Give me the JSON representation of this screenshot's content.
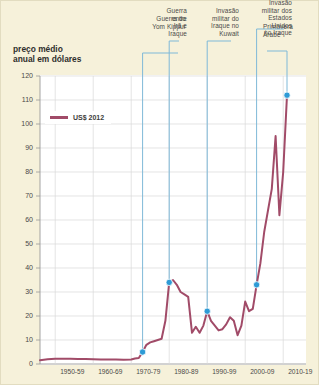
{
  "figure": {
    "title": "preço médio\nanual em dólares",
    "title_line1": "preço médio",
    "title_line2": "anual em dólares",
    "background_color": "#f6f1da",
    "plot_background_color": "#ffffff",
    "line_color": "#a14b68",
    "marker_color": "#2e9bd6",
    "annotation_line_color": "#7fb9d8",
    "grid_color": "#d8d8d8"
  },
  "legend": {
    "label": "US$ 2012",
    "position": "inside-top-left"
  },
  "annotations": [
    {
      "id": "yom-kippur",
      "lines": [
        "Guerra do",
        "Yom Kippur"
      ],
      "year": 1973,
      "align": "right"
    },
    {
      "id": "iran-iraq",
      "lines": [
        "Guerra",
        "entre",
        "Irã e",
        "Iraque"
      ],
      "year": 1980,
      "align": "right"
    },
    {
      "id": "kuwait",
      "lines": [
        "Invasão",
        "militar do",
        "Iraque no",
        "Kuwait"
      ],
      "year": 1990,
      "align": "right"
    },
    {
      "id": "us-iraq",
      "lines": [
        "Invasão",
        "militar dos",
        "Estados",
        "Unidos",
        "no Iraque"
      ],
      "year": 2003,
      "align": "right"
    },
    {
      "id": "arab-spring",
      "lines": [
        "Primavera",
        "Árabe"
      ],
      "year": 2011,
      "align": "left"
    }
  ],
  "chart_data": {
    "type": "line",
    "title": "preço médio anual em dólares",
    "xlabel": "",
    "ylabel": "preço médio anual em dólares",
    "ylim": [
      0,
      120
    ],
    "ytick_values": [
      0,
      10,
      20,
      30,
      40,
      50,
      60,
      70,
      80,
      90,
      100,
      110,
      120
    ],
    "xlim": [
      1946,
      2016
    ],
    "xtick_labels": [
      "1950-59",
      "1960-69",
      "1970-79",
      "1980-89",
      "1990-99",
      "2000-09",
      "2010-19"
    ],
    "xtick_years": [
      1954.5,
      1964.5,
      1974.5,
      1984.5,
      1994.5,
      2004.5,
      2014.5
    ],
    "grid": true,
    "legend_position": "inside-top-left",
    "series": [
      {
        "name": "US$ 2012",
        "color": "#a14b68",
        "x": [
          1946,
          1948,
          1950,
          1952,
          1954,
          1956,
          1958,
          1960,
          1962,
          1964,
          1966,
          1968,
          1970,
          1971,
          1972,
          1973,
          1974,
          1975,
          1976,
          1977,
          1978,
          1979,
          1980,
          1981,
          1982,
          1983,
          1984,
          1985,
          1986,
          1987,
          1988,
          1989,
          1990,
          1991,
          1992,
          1993,
          1994,
          1995,
          1996,
          1997,
          1998,
          1999,
          2000,
          2001,
          2002,
          2003,
          2004,
          2005,
          2006,
          2007,
          2008,
          2009,
          2010,
          2011
        ],
        "y": [
          1.6,
          2.0,
          2.2,
          2.2,
          2.2,
          2.1,
          2.1,
          2.0,
          1.9,
          1.9,
          1.9,
          1.8,
          1.9,
          2.3,
          2.5,
          5.0,
          8.0,
          9.0,
          9.5,
          10.0,
          10.5,
          18.0,
          34.0,
          35.0,
          33.0,
          30.0,
          29.0,
          28.0,
          13.0,
          15.5,
          13.0,
          16.0,
          22.0,
          18.0,
          16.0,
          14.0,
          14.5,
          16.5,
          19.5,
          18.0,
          12.0,
          16.0,
          26.0,
          22.0,
          23.0,
          33.0,
          42.0,
          55.0,
          64.0,
          73.0,
          95.0,
          62.0,
          80.0,
          112.0
        ]
      }
    ],
    "markers": [
      {
        "label": "Guerra do Yom Kippur",
        "year": 1973,
        "value": 5
      },
      {
        "label": "Guerra entre Irã e Iraque",
        "year": 1980,
        "value": 34
      },
      {
        "label": "Invasão militar do Iraque no Kuwait",
        "year": 1990,
        "value": 22
      },
      {
        "label": "Invasão militar dos Estados Unidos no Iraque",
        "year": 2003,
        "value": 33
      },
      {
        "label": "Primavera Árabe",
        "year": 2011,
        "value": 112
      }
    ]
  },
  "y_axis": {
    "ticks": [
      "120",
      "110",
      "100",
      "90",
      "80",
      "70",
      "60",
      "50",
      "40",
      "30",
      "20",
      "10",
      "0"
    ]
  },
  "x_axis": {
    "ticks": [
      "1950-59",
      "1960-69",
      "1970-79",
      "1980-89",
      "1990-99",
      "2000-09",
      "2010-19"
    ]
  }
}
